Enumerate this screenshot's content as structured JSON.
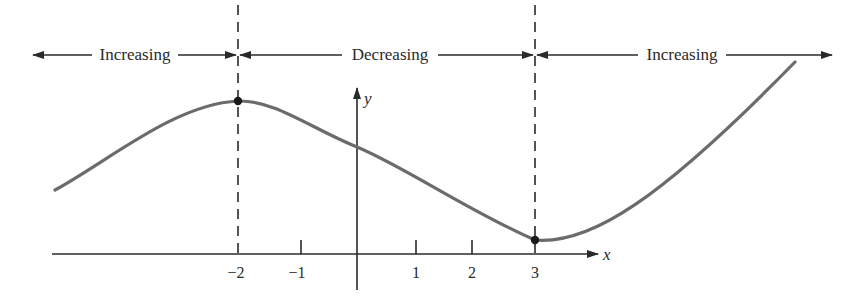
{
  "diagram": {
    "type": "function-monotonicity-graph",
    "intervals": [
      {
        "label": "Increasing",
        "from": "-inf",
        "to": -2
      },
      {
        "label": "Decreasing",
        "from": -2,
        "to": 3
      },
      {
        "label": "Increasing",
        "from": 3,
        "to": "inf"
      }
    ],
    "axes": {
      "x_label": "x",
      "y_label": "y",
      "x_ticks": [
        {
          "value": -2,
          "label": "−2"
        },
        {
          "value": -1,
          "label": "−1"
        },
        {
          "value": 1,
          "label": "1"
        },
        {
          "value": 2,
          "label": "2"
        },
        {
          "value": 3,
          "label": "3"
        }
      ]
    },
    "critical_points": [
      {
        "x": -2,
        "kind": "local maximum"
      },
      {
        "x": 3,
        "kind": "local minimum"
      }
    ],
    "dashed_lines_at": [
      -2,
      3
    ],
    "colors": {
      "curve": "#6b6b6b",
      "axis": "#2a2a2a",
      "text": "#2a2a2a"
    }
  }
}
